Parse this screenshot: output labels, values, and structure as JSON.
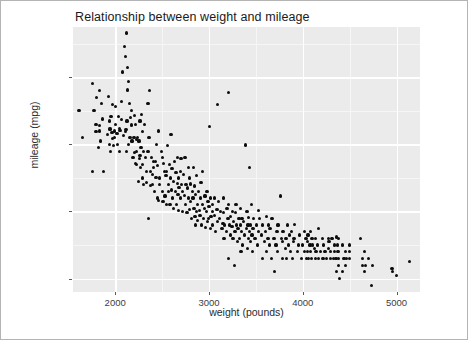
{
  "chart_data": {
    "type": "scatter",
    "title": "Relationship between weight and mileage",
    "xlabel": "weight (pounds)",
    "ylabel": "mileage (mpg)",
    "xlim": [
      1550,
      5250
    ],
    "ylim": [
      8.0,
      47.5
    ],
    "xticks": [
      2000,
      3000,
      4000,
      5000
    ],
    "yticks": [
      10,
      20,
      30,
      40
    ],
    "xtick_labels": [
      "2000",
      "3000",
      "4000",
      "5000"
    ],
    "ytick_labels": [
      "10",
      "20",
      "30",
      "40"
    ],
    "grid": true,
    "legend": null,
    "panel_background": "#ebebeb",
    "gridline_color": "#ffffff",
    "point_color": "#0d0d0d",
    "point_count": 392,
    "points": [
      [
        1613,
        35.0
      ],
      [
        1649,
        31.0
      ],
      [
        1755,
        39.1
      ],
      [
        1760,
        26.0
      ],
      [
        1773,
        35.1
      ],
      [
        1795,
        33.0
      ],
      [
        1795,
        31.9
      ],
      [
        1800,
        37.0
      ],
      [
        1825,
        29.5
      ],
      [
        1834,
        32.8
      ],
      [
        1835,
        32.0
      ],
      [
        1836,
        38.0
      ],
      [
        1845,
        30.5
      ],
      [
        1850,
        36.1
      ],
      [
        1867,
        33.8
      ],
      [
        1875,
        26.0
      ],
      [
        1915,
        31.5
      ],
      [
        1925,
        37.2
      ],
      [
        1937,
        33.5
      ],
      [
        1940,
        30.0
      ],
      [
        1945,
        32.3
      ],
      [
        1950,
        29.0
      ],
      [
        1955,
        34.1
      ],
      [
        1965,
        31.8
      ],
      [
        1968,
        30.9
      ],
      [
        1975,
        36.0
      ],
      [
        1985,
        29.8
      ],
      [
        1990,
        32.0
      ],
      [
        1995,
        31.0
      ],
      [
        2000,
        33.0
      ],
      [
        2003,
        35.7
      ],
      [
        2019,
        31.6
      ],
      [
        2025,
        30.0
      ],
      [
        2035,
        34.2
      ],
      [
        2045,
        32.4
      ],
      [
        2050,
        29.0
      ],
      [
        2051,
        32.1
      ],
      [
        2065,
        36.4
      ],
      [
        2070,
        33.7
      ],
      [
        2074,
        40.8
      ],
      [
        2085,
        31.3
      ],
      [
        2100,
        44.6
      ],
      [
        2108,
        43.1
      ],
      [
        2110,
        31.9
      ],
      [
        2115,
        32.2
      ],
      [
        2120,
        29.0
      ],
      [
        2124,
        46.6
      ],
      [
        2125,
        33.5
      ],
      [
        2130,
        41.5
      ],
      [
        2135,
        38.1
      ],
      [
        2144,
        39.4
      ],
      [
        2145,
        30.0
      ],
      [
        2155,
        36.1
      ],
      [
        2158,
        31.0
      ],
      [
        2164,
        34.0
      ],
      [
        2171,
        35.0
      ],
      [
        2175,
        32.9
      ],
      [
        2180,
        30.5
      ],
      [
        2190,
        28.0
      ],
      [
        2200,
        31.0
      ],
      [
        2205,
        34.3
      ],
      [
        2210,
        28.8
      ],
      [
        2215,
        33.0
      ],
      [
        2219,
        27.2
      ],
      [
        2223,
        30.7
      ],
      [
        2228,
        27.0
      ],
      [
        2230,
        29.0
      ],
      [
        2234,
        31.0
      ],
      [
        2245,
        24.5
      ],
      [
        2254,
        30.5
      ],
      [
        2255,
        27.9
      ],
      [
        2264,
        33.5
      ],
      [
        2265,
        28.4
      ],
      [
        2270,
        26.6
      ],
      [
        2275,
        29.5
      ],
      [
        2278,
        34.5
      ],
      [
        2288,
        31.9
      ],
      [
        2290,
        25.0
      ],
      [
        2295,
        27.0
      ],
      [
        2300,
        29.0
      ],
      [
        2300,
        24.0
      ],
      [
        2310,
        33.0
      ],
      [
        2320,
        28.1
      ],
      [
        2330,
        26.0
      ],
      [
        2335,
        24.3
      ],
      [
        2350,
        36.1
      ],
      [
        2350,
        29.0
      ],
      [
        2355,
        19.0
      ],
      [
        2360,
        31.0
      ],
      [
        2370,
        38.0
      ],
      [
        2375,
        23.9
      ],
      [
        2379,
        26.0
      ],
      [
        2385,
        28.0
      ],
      [
        2395,
        25.5
      ],
      [
        2400,
        24.0
      ],
      [
        2405,
        27.5
      ],
      [
        2408,
        26.5
      ],
      [
        2420,
        23.0
      ],
      [
        2430,
        27.4
      ],
      [
        2435,
        25.1
      ],
      [
        2440,
        30.0
      ],
      [
        2450,
        22.0
      ],
      [
        2455,
        26.8
      ],
      [
        2464,
        21.6
      ],
      [
        2465,
        32.0
      ],
      [
        2472,
        24.0
      ],
      [
        2475,
        25.0
      ],
      [
        2490,
        29.0
      ],
      [
        2500,
        23.0
      ],
      [
        2506,
        28.0
      ],
      [
        2510,
        21.5
      ],
      [
        2515,
        27.2
      ],
      [
        2525,
        26.0
      ],
      [
        2530,
        22.3
      ],
      [
        2542,
        25.4
      ],
      [
        2545,
        21.0
      ],
      [
        2550,
        26.0
      ],
      [
        2556,
        29.8
      ],
      [
        2565,
        24.0
      ],
      [
        2570,
        23.0
      ],
      [
        2575,
        27.0
      ],
      [
        2585,
        21.1
      ],
      [
        2590,
        25.0
      ],
      [
        2595,
        31.5
      ],
      [
        2600,
        23.2
      ],
      [
        2605,
        26.4
      ],
      [
        2615,
        22.0
      ],
      [
        2620,
        24.5
      ],
      [
        2625,
        20.5
      ],
      [
        2634,
        27.5
      ],
      [
        2640,
        23.0
      ],
      [
        2648,
        25.8
      ],
      [
        2655,
        21.0
      ],
      [
        2660,
        28.0
      ],
      [
        2665,
        24.2
      ],
      [
        2670,
        22.5
      ],
      [
        2672,
        25.0
      ],
      [
        2678,
        20.2
      ],
      [
        2680,
        23.6
      ],
      [
        2694,
        26.0
      ],
      [
        2700,
        22.0
      ],
      [
        2702,
        27.9
      ],
      [
        2710,
        24.0
      ],
      [
        2715,
        20.0
      ],
      [
        2720,
        23.0
      ],
      [
        2725,
        25.5
      ],
      [
        2740,
        22.4
      ],
      [
        2745,
        28.0
      ],
      [
        2750,
        21.0
      ],
      [
        2755,
        24.0
      ],
      [
        2765,
        19.8
      ],
      [
        2770,
        23.5
      ],
      [
        2780,
        26.5
      ],
      [
        2785,
        22.0
      ],
      [
        2789,
        20.3
      ],
      [
        2795,
        25.0
      ],
      [
        2800,
        21.5
      ],
      [
        2807,
        24.1
      ],
      [
        2815,
        19.0
      ],
      [
        2820,
        23.0
      ],
      [
        2830,
        22.0
      ],
      [
        2835,
        26.6
      ],
      [
        2840,
        20.5
      ],
      [
        2845,
        23.8
      ],
      [
        2850,
        19.2
      ],
      [
        2855,
        18.0
      ],
      [
        2860,
        22.5
      ],
      [
        2865,
        20.0
      ],
      [
        2868,
        25.4
      ],
      [
        2875,
        21.0
      ],
      [
        2880,
        18.6
      ],
      [
        2890,
        23.0
      ],
      [
        2900,
        20.2
      ],
      [
        2904,
        19.4
      ],
      [
        2910,
        22.0
      ],
      [
        2914,
        24.3
      ],
      [
        2920,
        18.0
      ],
      [
        2930,
        21.0
      ],
      [
        2933,
        26.0
      ],
      [
        2945,
        19.0
      ],
      [
        2950,
        20.5
      ],
      [
        2957,
        22.3
      ],
      [
        2965,
        17.6
      ],
      [
        2970,
        20.0
      ],
      [
        2979,
        23.0
      ],
      [
        2984,
        18.5
      ],
      [
        2990,
        21.5
      ],
      [
        2995,
        19.0
      ],
      [
        3000,
        20.8
      ],
      [
        3003,
        32.7
      ],
      [
        3012,
        22.0
      ],
      [
        3019,
        17.5
      ],
      [
        3021,
        19.2
      ],
      [
        3035,
        20.0
      ],
      [
        3039,
        21.0
      ],
      [
        3040,
        18.0
      ],
      [
        3055,
        19.4
      ],
      [
        3060,
        22.0
      ],
      [
        3070,
        17.0
      ],
      [
        3085,
        20.3
      ],
      [
        3090,
        36.0
      ],
      [
        3095,
        18.5
      ],
      [
        3102,
        21.5
      ],
      [
        3110,
        19.0
      ],
      [
        3121,
        20.0
      ],
      [
        3139,
        17.5
      ],
      [
        3150,
        18.2
      ],
      [
        3155,
        22.0
      ],
      [
        3158,
        19.8
      ],
      [
        3160,
        16.0
      ],
      [
        3169,
        18.0
      ],
      [
        3190,
        17.0
      ],
      [
        3193,
        20.5
      ],
      [
        3203,
        19.0
      ],
      [
        3205,
        13.0
      ],
      [
        3210,
        21.0
      ],
      [
        3211,
        37.7
      ],
      [
        3220,
        18.0
      ],
      [
        3230,
        16.5
      ],
      [
        3233,
        19.2
      ],
      [
        3245,
        17.8
      ],
      [
        3250,
        20.0
      ],
      [
        3257,
        16.0
      ],
      [
        3264,
        18.5
      ],
      [
        3270,
        12.0
      ],
      [
        3278,
        17.0
      ],
      [
        3282,
        19.9
      ],
      [
        3288,
        21.1
      ],
      [
        3290,
        18.0
      ],
      [
        3302,
        15.5
      ],
      [
        3310,
        17.5
      ],
      [
        3320,
        19.0
      ],
      [
        3329,
        16.0
      ],
      [
        3336,
        20.5
      ],
      [
        3336,
        18.0
      ],
      [
        3341,
        14.0
      ],
      [
        3350,
        17.0
      ],
      [
        3353,
        19.0
      ],
      [
        3360,
        15.0
      ],
      [
        3365,
        18.5
      ],
      [
        3381,
        16.5
      ],
      [
        3388,
        29.9
      ],
      [
        3400,
        17.5
      ],
      [
        3405,
        20.0
      ],
      [
        3410,
        14.5
      ],
      [
        3415,
        18.0
      ],
      [
        3420,
        16.0
      ],
      [
        3425,
        19.1
      ],
      [
        3430,
        17.0
      ],
      [
        3433,
        26.6
      ],
      [
        3439,
        15.5
      ],
      [
        3445,
        18.0
      ],
      [
        3449,
        21.0
      ],
      [
        3459,
        16.5
      ],
      [
        3465,
        14.0
      ],
      [
        3470,
        17.5
      ],
      [
        3475,
        19.0
      ],
      [
        3490,
        16.0
      ],
      [
        3504,
        18.0
      ],
      [
        3520,
        15.0
      ],
      [
        3525,
        17.0
      ],
      [
        3530,
        20.2
      ],
      [
        3535,
        19.0
      ],
      [
        3563,
        16.5
      ],
      [
        3570,
        13.0
      ],
      [
        3574,
        18.0
      ],
      [
        3590,
        15.5
      ],
      [
        3605,
        17.0
      ],
      [
        3609,
        19.2
      ],
      [
        3613,
        14.0
      ],
      [
        3630,
        16.0
      ],
      [
        3632,
        18.0
      ],
      [
        3645,
        15.0
      ],
      [
        3651,
        17.5
      ],
      [
        3664,
        13.0
      ],
      [
        3672,
        19.0
      ],
      [
        3693,
        16.0
      ],
      [
        3700,
        11.0
      ],
      [
        3715,
        15.0
      ],
      [
        3725,
        17.0
      ],
      [
        3730,
        14.0
      ],
      [
        3735,
        18.0
      ],
      [
        3761,
        22.3
      ],
      [
        3777,
        16.0
      ],
      [
        3781,
        13.0
      ],
      [
        3785,
        15.5
      ],
      [
        3790,
        17.0
      ],
      [
        3820,
        14.5
      ],
      [
        3821,
        16.0
      ],
      [
        3830,
        13.0
      ],
      [
        3840,
        18.0
      ],
      [
        3850,
        15.0
      ],
      [
        3860,
        16.5
      ],
      [
        3870,
        14.0
      ],
      [
        3880,
        17.0
      ],
      [
        3892,
        13.0
      ],
      [
        3900,
        15.5
      ],
      [
        3907,
        16.0
      ],
      [
        3910,
        18.1
      ],
      [
        3940,
        14.0
      ],
      [
        3955,
        15.0
      ],
      [
        3962,
        16.5
      ],
      [
        3988,
        13.0
      ],
      [
        4000,
        15.0
      ],
      [
        4020,
        17.0
      ],
      [
        4022,
        14.0
      ],
      [
        4035,
        16.0
      ],
      [
        4042,
        13.0
      ],
      [
        4050,
        15.5
      ],
      [
        4054,
        14.0
      ],
      [
        4055,
        16.5
      ],
      [
        4060,
        13.0
      ],
      [
        4077,
        15.0
      ],
      [
        4080,
        17.0
      ],
      [
        4082,
        14.0
      ],
      [
        4096,
        13.0
      ],
      [
        4098,
        16.0
      ],
      [
        4100,
        15.0
      ],
      [
        4129,
        14.5
      ],
      [
        4135,
        13.0
      ],
      [
        4140,
        16.0
      ],
      [
        4141,
        14.0
      ],
      [
        4154,
        15.0
      ],
      [
        4165,
        13.0
      ],
      [
        4166,
        17.5
      ],
      [
        4190,
        14.0
      ],
      [
        4209,
        16.0
      ],
      [
        4215,
        13.0
      ],
      [
        4220,
        15.0
      ],
      [
        4237,
        14.0
      ],
      [
        4257,
        13.0
      ],
      [
        4274,
        16.0
      ],
      [
        4278,
        14.5
      ],
      [
        4280,
        15.5
      ],
      [
        4294,
        13.0
      ],
      [
        4295,
        14.0
      ],
      [
        4312,
        16.0
      ],
      [
        4325,
        13.0
      ],
      [
        4335,
        15.0
      ],
      [
        4341,
        14.0
      ],
      [
        4354,
        13.0
      ],
      [
        4360,
        16.2
      ],
      [
        4363,
        11.0
      ],
      [
        4368,
        15.0
      ],
      [
        4376,
        14.0
      ],
      [
        4380,
        12.0
      ],
      [
        4382,
        13.0
      ],
      [
        4385,
        16.0
      ],
      [
        4390,
        10.0
      ],
      [
        4422,
        15.0
      ],
      [
        4425,
        11.0
      ],
      [
        4440,
        13.0
      ],
      [
        4456,
        14.0
      ],
      [
        4457,
        12.0
      ],
      [
        4464,
        13.0
      ],
      [
        4498,
        15.0
      ],
      [
        4499,
        14.0
      ],
      [
        4502,
        13.0
      ],
      [
        4615,
        16.0
      ],
      [
        4633,
        12.0
      ],
      [
        4638,
        13.0
      ],
      [
        4654,
        11.0
      ],
      [
        4657,
        14.0
      ],
      [
        4668,
        12.0
      ],
      [
        4699,
        13.0
      ],
      [
        4735,
        9.0
      ],
      [
        4746,
        12.0
      ],
      [
        4951,
        11.5
      ],
      [
        4955,
        11.0
      ],
      [
        4997,
        10.5
      ],
      [
        5140,
        12.5
      ]
    ]
  }
}
